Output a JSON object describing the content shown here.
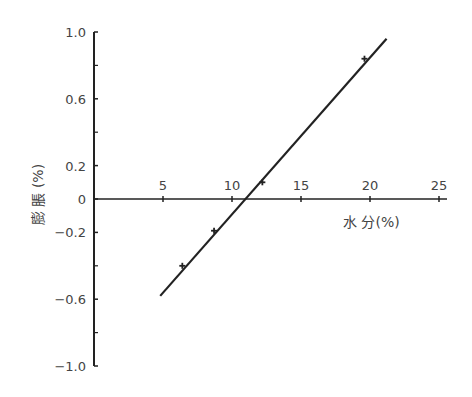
{
  "chart_data": {
    "type": "line",
    "title": "",
    "xlabel": "水 分(%)",
    "ylabel": "膨 脹 (%)",
    "xlim": [
      0,
      25
    ],
    "ylim": [
      -1.0,
      1.0
    ],
    "x_ticks": [
      5,
      10,
      15,
      20,
      25
    ],
    "x_tick_labels": [
      "5",
      "10",
      "15",
      "20",
      "25"
    ],
    "y_ticks": [
      1.0,
      0.6,
      0.2,
      0,
      -0.2,
      -0.6,
      -1.0
    ],
    "y_tick_labels": [
      "1.0",
      "0.6",
      "0.2",
      "0",
      "-0.2",
      "-0.6",
      "-1.0"
    ],
    "y_minor_ticks": [
      0.8,
      0.4,
      -0.4,
      -0.8
    ],
    "grid": false,
    "legend": null,
    "series": [
      {
        "name": "fit line",
        "kind": "line",
        "x": [
          4.8,
          21.2
        ],
        "y": [
          -0.58,
          0.96
        ]
      },
      {
        "name": "measured",
        "kind": "markers",
        "x": [
          6.4,
          8.7,
          12.2,
          19.6
        ],
        "y": [
          -0.4,
          -0.19,
          0.1,
          0.84
        ]
      }
    ]
  },
  "layout": {
    "plot_origin_px": [
      94,
      199
    ],
    "x_px_per_unit": 13.8,
    "y_px_per_unit": 167,
    "line_color": "#222222"
  }
}
